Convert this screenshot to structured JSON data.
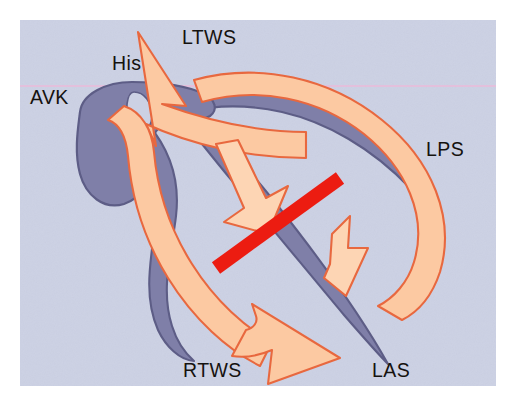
{
  "figure": {
    "kind": "anatomical-diagram",
    "background_color": "#ffffff",
    "panel_color": "#ccd1e4",
    "panel_noise": true
  },
  "colors": {
    "panel_background": "#ccd1e4",
    "tissue_purple_fill": "#7f7fa8",
    "tissue_purple_stroke": "#5d5d86",
    "arrow_fill": "#fcc9a2",
    "arrow_fill_light": "#fdd5b4",
    "arrow_stroke": "#e8683f",
    "ablation_red": "#ec1c11",
    "scanline_pink": "#f0b7d8",
    "label_text": "#15120f"
  },
  "labels": [
    {
      "id": "ltws",
      "text": "LTWS",
      "x": 162,
      "y": 24,
      "anchor": "start"
    },
    {
      "id": "his",
      "text": "His",
      "x": 92,
      "y": 50,
      "anchor": "start"
    },
    {
      "id": "avk",
      "text": "AVK",
      "x": 10,
      "y": 84,
      "anchor": "start"
    },
    {
      "id": "lps",
      "text": "LPS",
      "x": 406,
      "y": 136,
      "anchor": "start"
    },
    {
      "id": "rtws",
      "text": "RTWS",
      "x": 163,
      "y": 357,
      "anchor": "start"
    },
    {
      "id": "las",
      "text": "LAS",
      "x": 352,
      "y": 357,
      "anchor": "start"
    }
  ],
  "label_meanings": {
    "LTWS": "left true wall septum",
    "His": "His bundle",
    "AVK": "AV node",
    "LPS": "left posterior septum",
    "RTWS": "right true wall septum",
    "LAS": "left anterior septum"
  },
  "elements": {
    "ablation_line": {
      "name": "ablation-line",
      "color": "#ec1c11",
      "orientation": "diagonal-up-right"
    },
    "scanline": {
      "name": "horizontal-scanline",
      "y": 66,
      "color": "#f0b7d8"
    },
    "av_node": {
      "name": "av-node-body",
      "shape": "teardrop"
    },
    "his_bundle": {
      "name": "his-bundle-band"
    },
    "lps_band": {
      "name": "lps-conduction-band"
    },
    "las_band": {
      "name": "las-conduction-band"
    },
    "rtws_band": {
      "name": "rtws-conduction-band"
    },
    "arrows": [
      {
        "name": "ltws-arrow",
        "direction": "up-left",
        "size": "large"
      },
      {
        "name": "rtws-arrow",
        "direction": "right-down",
        "size": "large"
      },
      {
        "name": "reentry-loop-arrow",
        "direction": "clockwise",
        "size": "large"
      },
      {
        "name": "block-arrow-upper",
        "direction": "down-right",
        "size": "small"
      },
      {
        "name": "block-arrow-lower",
        "direction": "up-right",
        "size": "small"
      }
    ]
  }
}
